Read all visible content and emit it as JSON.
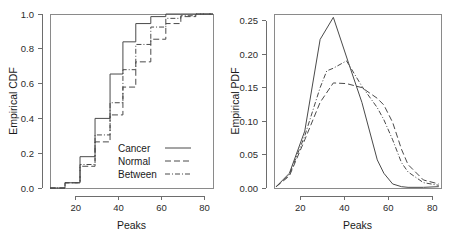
{
  "figure": {
    "background": "#ffffff",
    "line_color": "#4a4a4a",
    "axis_color": "#6d6d6d"
  },
  "chart_data": [
    {
      "id": "cdf",
      "type": "line",
      "title": "",
      "xlabel": "Peaks",
      "ylabel": "Empirical CDF",
      "xlim": [
        8,
        84
      ],
      "ylim": [
        0.0,
        1.0
      ],
      "xticks": [
        20,
        40,
        60,
        80
      ],
      "xticklabels": [
        "20",
        "40",
        "60",
        "80"
      ],
      "yticks": [
        0.0,
        0.2,
        0.4,
        0.6,
        0.8,
        1.0
      ],
      "yticklabels": [
        "0.0",
        "0.2",
        "0.4",
        "0.6",
        "0.8",
        "1.0"
      ],
      "grid": false,
      "step": true,
      "legend_position": "center-right-inside",
      "series": [
        {
          "name": "Cancer",
          "linestyle": "solid",
          "x": [
            8,
            15,
            15,
            22,
            22,
            29,
            29,
            36,
            36,
            42,
            42,
            48,
            48,
            55,
            55,
            62,
            62,
            69,
            69,
            76,
            76,
            84
          ],
          "y": [
            0.0,
            0.0,
            0.03,
            0.03,
            0.18,
            0.18,
            0.4,
            0.4,
            0.655,
            0.655,
            0.84,
            0.84,
            0.945,
            0.945,
            0.985,
            0.985,
            1.0,
            1.0,
            1.0,
            1.0,
            1.0,
            1.0
          ]
        },
        {
          "name": "Normal",
          "linestyle": "dashed",
          "x": [
            8,
            15,
            15,
            22,
            22,
            29,
            29,
            36,
            36,
            42,
            42,
            48,
            48,
            55,
            55,
            62,
            62,
            69,
            69,
            76,
            76,
            84
          ],
          "y": [
            0.0,
            0.0,
            0.03,
            0.03,
            0.125,
            0.125,
            0.265,
            0.265,
            0.42,
            0.42,
            0.58,
            0.58,
            0.725,
            0.725,
            0.855,
            0.855,
            0.945,
            0.945,
            0.985,
            0.985,
            1.0,
            1.0
          ]
        },
        {
          "name": "Between",
          "linestyle": "dashdot",
          "x": [
            8,
            15,
            15,
            22,
            22,
            29,
            29,
            36,
            36,
            42,
            42,
            48,
            48,
            55,
            55,
            62,
            62,
            69,
            69,
            76,
            76,
            84
          ],
          "y": [
            0.0,
            0.0,
            0.03,
            0.03,
            0.135,
            0.135,
            0.305,
            0.305,
            0.49,
            0.49,
            0.68,
            0.68,
            0.825,
            0.825,
            0.925,
            0.925,
            0.975,
            0.975,
            0.99,
            0.99,
            1.0,
            1.0
          ]
        }
      ]
    },
    {
      "id": "pdf",
      "type": "line",
      "title": "",
      "xlabel": "Peaks",
      "ylabel": "Empirical PDF",
      "xlim": [
        8,
        84
      ],
      "ylim": [
        0.0,
        0.26
      ],
      "xticks": [
        20,
        40,
        60,
        80
      ],
      "xticklabels": [
        "20",
        "40",
        "60",
        "80"
      ],
      "yticks": [
        0.0,
        0.05,
        0.1,
        0.15,
        0.2,
        0.25
      ],
      "yticklabels": [
        "0.00",
        "0.05",
        "0.10",
        "0.15",
        "0.20",
        "0.25"
      ],
      "grid": false,
      "step": false,
      "legend_position": "none",
      "series": [
        {
          "name": "Cancer",
          "linestyle": "solid",
          "x": [
            9,
            15,
            22,
            29,
            35,
            42,
            48,
            55,
            58,
            62,
            66,
            69,
            76,
            83
          ],
          "y": [
            0.002,
            0.022,
            0.085,
            0.222,
            0.255,
            0.186,
            0.128,
            0.042,
            0.022,
            0.006,
            0.002,
            0.001,
            0.001,
            0.002
          ]
        },
        {
          "name": "Normal",
          "linestyle": "dashed",
          "x": [
            9,
            15,
            22,
            29,
            35,
            41,
            48,
            55,
            58,
            62,
            66,
            69,
            76,
            83
          ],
          "y": [
            0.002,
            0.018,
            0.072,
            0.128,
            0.157,
            0.156,
            0.15,
            0.134,
            0.124,
            0.098,
            0.058,
            0.035,
            0.012,
            0.006
          ]
        },
        {
          "name": "Between",
          "linestyle": "dashdot",
          "x": [
            9,
            15,
            22,
            29,
            32,
            35,
            41,
            48,
            55,
            58,
            62,
            66,
            69,
            76,
            83
          ],
          "y": [
            0.002,
            0.02,
            0.078,
            0.15,
            0.175,
            0.179,
            0.19,
            0.152,
            0.12,
            0.102,
            0.072,
            0.038,
            0.024,
            0.008,
            0.004
          ]
        }
      ]
    }
  ],
  "legend": {
    "items": [
      {
        "label": "Cancer",
        "linestyle": "solid"
      },
      {
        "label": "Normal",
        "linestyle": "dashed"
      },
      {
        "label": "Between",
        "linestyle": "dashdot"
      }
    ]
  }
}
